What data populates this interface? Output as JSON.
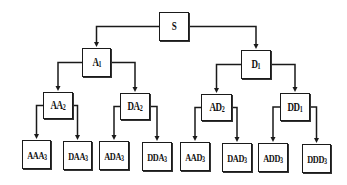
{
  "diagram": {
    "type": "binary-tree",
    "colors": {
      "line": "#1a1a1a",
      "box_border": "#1a1a1a",
      "background": "#ffffff"
    },
    "nodes": [
      {
        "id": "S",
        "base": "S",
        "sub": "",
        "level": 0,
        "x": 159,
        "y": 12,
        "w": 30,
        "h": 29
      },
      {
        "id": "A1",
        "base": "A",
        "sub": "1",
        "level": 1,
        "x": 82,
        "y": 48,
        "w": 29,
        "h": 29
      },
      {
        "id": "D1",
        "base": "D",
        "sub": "1",
        "level": 1,
        "x": 241,
        "y": 50,
        "w": 30,
        "h": 29
      },
      {
        "id": "AA2",
        "base": "AA",
        "sub": "2",
        "level": 2,
        "x": 43,
        "y": 92,
        "w": 30,
        "h": 27
      },
      {
        "id": "DA2",
        "base": "DA",
        "sub": "2",
        "level": 2,
        "x": 120,
        "y": 93,
        "w": 30,
        "h": 27
      },
      {
        "id": "AD2",
        "base": "AD",
        "sub": "2",
        "level": 2,
        "x": 201,
        "y": 94,
        "w": 31,
        "h": 27
      },
      {
        "id": "DD1",
        "base": "DD",
        "sub": "1",
        "level": 2,
        "x": 280,
        "y": 93,
        "w": 30,
        "h": 28
      },
      {
        "id": "AAA3",
        "base": "AAA",
        "sub": "3",
        "level": 3,
        "x": 22,
        "y": 140,
        "w": 29,
        "h": 29
      },
      {
        "id": "DAA3",
        "base": "DAA",
        "sub": "3",
        "level": 3,
        "x": 63,
        "y": 141,
        "w": 29,
        "h": 29
      },
      {
        "id": "ADA3",
        "base": "ADA",
        "sub": "3",
        "level": 3,
        "x": 99,
        "y": 141,
        "w": 30,
        "h": 29
      },
      {
        "id": "DDA3",
        "base": "DDA",
        "sub": "3",
        "level": 3,
        "x": 142,
        "y": 142,
        "w": 30,
        "h": 29
      },
      {
        "id": "AAD3",
        "base": "AAD",
        "sub": "3",
        "level": 3,
        "x": 180,
        "y": 142,
        "w": 30,
        "h": 29
      },
      {
        "id": "DAD3",
        "base": "DAD",
        "sub": "3",
        "level": 3,
        "x": 222,
        "y": 143,
        "w": 30,
        "h": 29
      },
      {
        "id": "ADD3",
        "base": "ADD",
        "sub": "3",
        "level": 3,
        "x": 258,
        "y": 143,
        "w": 30,
        "h": 29
      },
      {
        "id": "DDD3",
        "base": "DDD",
        "sub": "3",
        "level": 3,
        "x": 302,
        "y": 144,
        "w": 29,
        "h": 29
      }
    ],
    "edges": [
      [
        "S",
        "A1"
      ],
      [
        "S",
        "D1"
      ],
      [
        "A1",
        "AA2"
      ],
      [
        "A1",
        "DA2"
      ],
      [
        "D1",
        "AD2"
      ],
      [
        "D1",
        "DD1"
      ],
      [
        "AA2",
        "AAA3"
      ],
      [
        "AA2",
        "DAA3"
      ],
      [
        "DA2",
        "ADA3"
      ],
      [
        "DA2",
        "DDA3"
      ],
      [
        "AD2",
        "AAD3"
      ],
      [
        "AD2",
        "DAD3"
      ],
      [
        "DD1",
        "ADD3"
      ],
      [
        "DD1",
        "DDD3"
      ]
    ]
  }
}
